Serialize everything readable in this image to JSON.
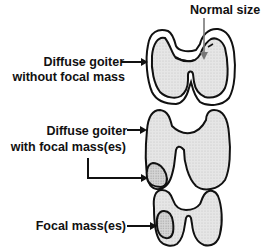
{
  "labels": {
    "normal_size": "Normal size",
    "diffuse_no_mass_line1": "Diffuse goiter",
    "diffuse_no_mass_line2": "without focal mass",
    "diffuse_with_mass_line1": "Diffuse goiter",
    "diffuse_with_mass_line2": "with focal mass(es)",
    "focal_mass": "Focal mass(es)"
  },
  "colors": {
    "outline": "#111111",
    "gland_fill": "#e4e4e4",
    "mass_fill": "#cfcfcf",
    "normal_arrow": "#777777"
  }
}
